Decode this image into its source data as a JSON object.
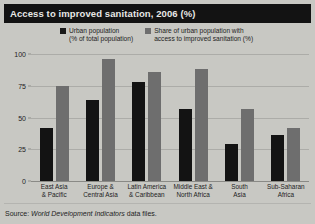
{
  "title": "Access to improved sanitation, 2006 (%)",
  "source_prefix": "Source: ",
  "source_italic": "World Development Indicators",
  "source_suffix": " data files.",
  "legend": [
    {
      "label": "Urban population\n(% of total population)",
      "color": "#131313",
      "swatch": "dark"
    },
    {
      "label": "Share of urban population with\naccess to improved sanitation (%)",
      "color": "#6e6e6e",
      "swatch": "gray"
    }
  ],
  "chart_data": {
    "type": "bar",
    "title": "Access to improved sanitation, 2006 (%)",
    "xlabel": "",
    "ylabel": "",
    "ylim": [
      0,
      100
    ],
    "yticks": [
      0,
      25,
      50,
      75,
      100
    ],
    "ytick_labels": [
      "0",
      "25",
      "50",
      "75",
      "100"
    ],
    "grid": true,
    "legend_position": "top",
    "categories": [
      "East Asia\n& Pacific",
      "Europe &\nCentral Asia",
      "Latin America\n& Caribbean",
      "Middle East &\nNorth Africa",
      "South\nAsia",
      "Sub-Saharan\nAfrica"
    ],
    "series": [
      {
        "name": "Urban population (% of total population)",
        "color": "#131313",
        "values": [
          42,
          64,
          78,
          57,
          29,
          36
        ]
      },
      {
        "name": "Share of urban population with access to improved sanitation (%)",
        "color": "#6e6e6e",
        "values": [
          75,
          96,
          86,
          88,
          57,
          42
        ]
      }
    ]
  }
}
